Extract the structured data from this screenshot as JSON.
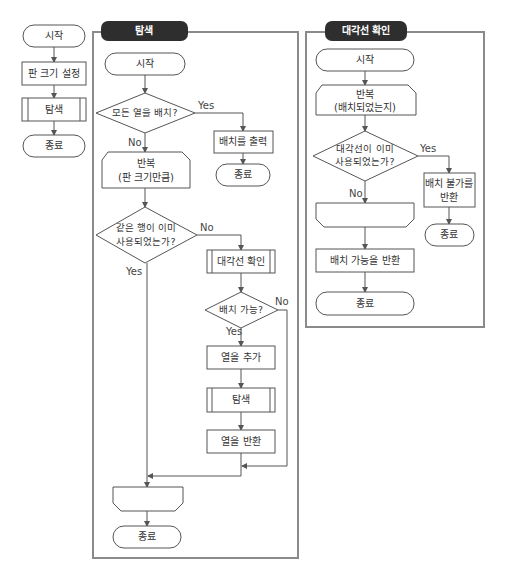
{
  "main_flow": {
    "start": "시작",
    "set_size": "판 크기 설정",
    "search": "탐색",
    "end": "종료"
  },
  "search_panel": {
    "title": "탐색",
    "start": "시작",
    "decision_all": "모든 열을 배치?",
    "yes1": "Yes",
    "no1": "No",
    "print": "배치를 출력",
    "end_right": "종료",
    "loop_line1": "반복",
    "loop_line2": "(판 크기만큼)",
    "decision_row_line1": "같은 행이 이미",
    "decision_row_line2": "사용되었는가?",
    "no2": "No",
    "yes2": "Yes",
    "diag_check": "대각선 확인",
    "decision_place": "배치 가능?",
    "yes3": "Yes",
    "no3": "No",
    "add_col": "열을 추가",
    "search_sub": "탐색",
    "return_col": "열을 반환",
    "end": "종료"
  },
  "diag_panel": {
    "title": "대각선 확인",
    "start": "시작",
    "loop_line1": "반복",
    "loop_line2": "(배치되었는지)",
    "decision_line1": "대각선이 이미",
    "decision_line2": "사용되었는가?",
    "yes": "Yes",
    "no": "No",
    "return_fail_line1": "배치 불가를",
    "return_fail_line2": "반환",
    "end_right": "종료",
    "return_ok": "배치 가능을 반환",
    "end": "종료"
  }
}
